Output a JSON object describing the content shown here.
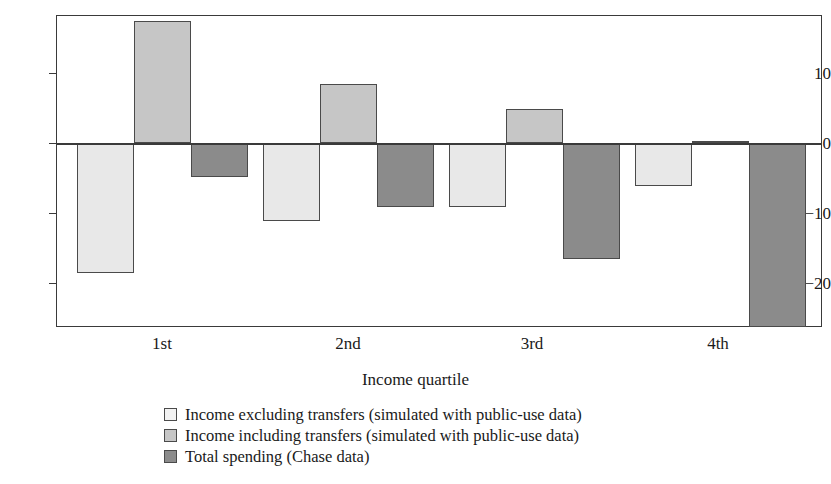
{
  "figure": {
    "clipped_top_text": "",
    "background": "#ffffff"
  },
  "chart_data": {
    "type": "bar",
    "title": "",
    "xlabel": "Income quartile",
    "ylabel": "",
    "categories": [
      "1st",
      "2nd",
      "3rd",
      "4th"
    ],
    "ytick_labels": [
      "10",
      "0",
      "−10",
      "−20"
    ],
    "ytick_values": [
      10,
      0,
      -10,
      -20
    ],
    "ylim": [
      -26.5,
      18.5
    ],
    "grid": false,
    "legend_position": "below",
    "series": [
      {
        "name": "Income excluding transfers (simulated with public-use data)",
        "color": "#e8e8e8",
        "values": [
          -18.6,
          -11.2,
          -9.1,
          -6.2
        ]
      },
      {
        "name": "Income including transfers (simulated with public-use data)",
        "color": "#c6c6c6",
        "values": [
          17.5,
          8.5,
          4.8,
          0.3
        ]
      },
      {
        "name": "Total spending (Chase data)",
        "color": "#8b8b8b",
        "values": [
          -4.8,
          -9.2,
          -16.6,
          -26.3
        ]
      }
    ]
  },
  "legend": {
    "items": [
      {
        "label": "Income excluding transfers (simulated with public-use data)",
        "swatch": "legend-swatch-income-excluding-transfers"
      },
      {
        "label": "Income including transfers (simulated with public-use data)",
        "swatch": "legend-swatch-income-including-transfers"
      },
      {
        "label": "Total spending (Chase data)",
        "swatch": "legend-swatch-total-spending"
      }
    ]
  }
}
